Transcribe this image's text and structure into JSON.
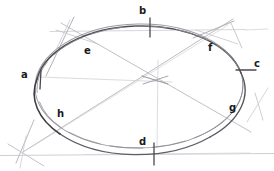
{
  "figure": {
    "medium": "pencil-drawing",
    "background_color": "#ffffff",
    "width": 274,
    "height": 171,
    "stroke_colors": {
      "ellipse_dark": "#3a3a3f",
      "ellipse_mid": "#5b5b62",
      "construction_light": "#b6b6bc",
      "construction_faint": "#cfcfd4",
      "baseline": "#c6c6cb",
      "label_text": "#1a1a1a"
    },
    "ellipse": {
      "center_x": 139,
      "center_y": 86,
      "radius_x": 104,
      "radius_y": 62,
      "rotation_deg": -1
    },
    "labels": [
      {
        "id": "a",
        "text": "a",
        "x": 22,
        "y": 70,
        "note": "left axis vertex, west"
      },
      {
        "id": "b",
        "text": "b",
        "x": 139,
        "y": 6,
        "note": "top axis vertex, north"
      },
      {
        "id": "c",
        "text": "c",
        "x": 253,
        "y": 60,
        "note": "right axis vertex, east"
      },
      {
        "id": "d",
        "text": "d",
        "x": 139,
        "y": 138,
        "note": "bottom axis vertex, south"
      },
      {
        "id": "e",
        "text": "e",
        "x": 84,
        "y": 47,
        "note": "upper-left conjugate point"
      },
      {
        "id": "f",
        "text": "f",
        "x": 208,
        "y": 44,
        "note": "upper-right conjugate point"
      },
      {
        "id": "g",
        "text": "g",
        "x": 229,
        "y": 104,
        "note": "lower-right conjugate point"
      },
      {
        "id": "h",
        "text": "h",
        "x": 57,
        "y": 110,
        "note": "lower-left conjugate point"
      }
    ],
    "tick_marks": [
      {
        "at": "a",
        "orientation": "vertical",
        "x": 41,
        "y": 79
      },
      {
        "at": "b",
        "orientation": "vertical",
        "x": 150,
        "y": 26
      },
      {
        "at": "c",
        "orientation": "horizontal",
        "x": 246,
        "y": 70
      },
      {
        "at": "d",
        "orientation": "vertical",
        "x": 154,
        "y": 153
      }
    ],
    "guide_lines": [
      {
        "name": "top-horizontal-guide",
        "x1": 50,
        "y1": 31,
        "x2": 246,
        "y2": 30
      },
      {
        "name": "bottom-horizontal-base",
        "x1": 0,
        "y1": 155,
        "x2": 274,
        "y2": 153
      },
      {
        "name": "diagonal-e-to-g",
        "x1": 62,
        "y1": 24,
        "x2": 250,
        "y2": 131
      },
      {
        "name": "diagonal-f-to-h",
        "x1": 232,
        "y1": 20,
        "x2": 24,
        "y2": 151
      },
      {
        "name": "tangent-upper-left",
        "x1": 73,
        "y1": 19,
        "x2": 47,
        "y2": 75
      },
      {
        "name": "tangent-upper-right",
        "x1": 232,
        "y1": 22,
        "x2": 196,
        "y2": 37
      },
      {
        "name": "tangent-right-short",
        "x1": 230,
        "y1": 23,
        "x2": 241,
        "y2": 47
      },
      {
        "name": "tangent-lower-left-a",
        "x1": 33,
        "y1": 122,
        "x2": 18,
        "y2": 160
      },
      {
        "name": "tangent-lower-left-b",
        "x1": 10,
        "y1": 143,
        "x2": 40,
        "y2": 163
      },
      {
        "name": "center-cross-vertical",
        "x1": 158,
        "y1": 62,
        "x2": 158,
        "y2": 146
      },
      {
        "name": "center-cross-horizontal",
        "x1": 40,
        "y1": 76,
        "x2": 170,
        "y2": 82
      },
      {
        "name": "right-edge-hook",
        "x1": 254,
        "y1": 95,
        "x2": 262,
        "y2": 118
      },
      {
        "name": "right-edge-hook-2",
        "x1": 266,
        "y1": 90,
        "x2": 249,
        "y2": 120
      }
    ]
  }
}
